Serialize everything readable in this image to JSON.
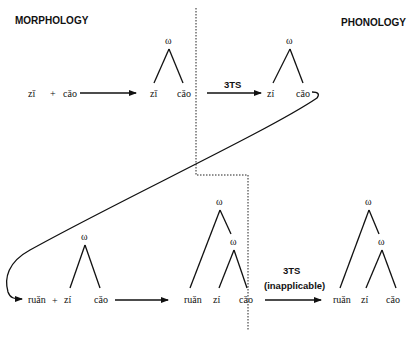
{
  "headers": {
    "left": "MORPHOLOGY",
    "right": "PHONOLOGY"
  },
  "node_label": "ω",
  "row1": {
    "input": {
      "syl1": "zǐ",
      "plus": "+",
      "syl2": "cǎo"
    },
    "tree_morph": {
      "root": "ω",
      "leaves": [
        "zǐ",
        "cǎo"
      ]
    },
    "rule": "3TS",
    "tree_phon": {
      "root": "ω",
      "leaves": [
        "zí",
        "cǎo"
      ]
    }
  },
  "row2": {
    "input": {
      "syl1": "ruǎn",
      "plus": "+",
      "tree": {
        "root": "ω",
        "leaves": [
          "zí",
          "cǎo"
        ]
      }
    },
    "tree_morph": {
      "root": "ω",
      "inner": "ω",
      "leaves": [
        "ruǎn",
        "zí",
        "cǎo"
      ]
    },
    "rule": "3TS",
    "rule_note": "(inapplicable)",
    "tree_phon": {
      "root": "ω",
      "inner": "ω",
      "leaves": [
        "ruǎn",
        "zí",
        "cǎo"
      ]
    }
  }
}
